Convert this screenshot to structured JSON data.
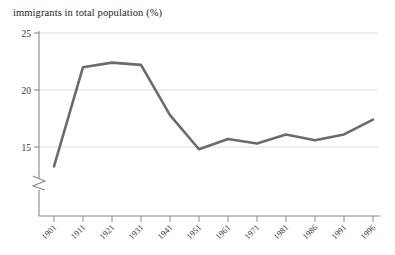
{
  "chart_data": {
    "type": "line",
    "title": "immigrants in total population (%)",
    "xlabel": "",
    "ylabel": "",
    "categories": [
      "1901",
      "1911",
      "1921",
      "1931",
      "1941",
      "1951",
      "1961",
      "1971",
      "1981",
      "1986",
      "1991",
      "1996"
    ],
    "values": [
      13.3,
      22.0,
      22.4,
      22.2,
      17.8,
      14.8,
      15.7,
      15.3,
      16.1,
      15.6,
      16.1,
      17.4
    ],
    "series": [
      {
        "name": "immigrants in total population (%)",
        "values": [
          13.3,
          22.0,
          22.4,
          22.2,
          17.8,
          14.8,
          15.7,
          15.3,
          16.1,
          15.6,
          16.1,
          17.4
        ]
      }
    ],
    "ylim": [
      13.0,
      25.6
    ],
    "yticks": [
      15,
      20,
      25
    ],
    "ytick_labels": [
      "15",
      "20",
      "25"
    ],
    "grid": true,
    "grid_axis": "y",
    "legend": "none",
    "axis_break": true,
    "axis_break_note": "y-axis broken below 15",
    "line_color": "#6b6b6b",
    "grid_color": "#d9d9d9",
    "axis_color": "#808080"
  },
  "labels": {
    "y_axis_break_marker": "axis-break"
  }
}
